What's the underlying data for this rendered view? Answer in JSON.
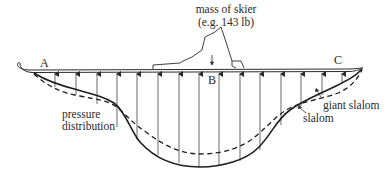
{
  "title_label": {
    "line1": "mass of skier",
    "line2": "(e.g. 143 lb)"
  },
  "points": {
    "a": "A",
    "b": "B",
    "c": "C"
  },
  "labels": {
    "pressure_line1": "pressure",
    "pressure_line2": "distribution",
    "giant_slalom": "giant slalom",
    "slalom": "slalom"
  },
  "colors": {
    "ink": "#2a2a2a",
    "background": "#ffffff"
  },
  "legend": [
    {
      "name": "giant slalom",
      "style": "solid"
    },
    {
      "name": "slalom",
      "style": "dashed"
    }
  ]
}
